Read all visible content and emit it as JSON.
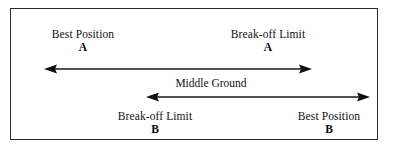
{
  "diagram": {
    "frame": {
      "border_color": "#2b2b2b",
      "background": "#ffffff"
    },
    "labels": {
      "best_position_a": {
        "text": "Best Position",
        "letter": "A"
      },
      "breakoff_limit_a": {
        "text": "Break-off Limit",
        "letter": "A"
      },
      "middle_ground": {
        "text": "Middle Ground"
      },
      "breakoff_limit_b": {
        "text": "Break-off Limit",
        "letter": "B"
      },
      "best_position_b": {
        "text": "Best Position",
        "letter": "B"
      }
    },
    "arrows": [
      {
        "name": "range-arrow-a",
        "style": "double-headed",
        "color": "#1a1a1a",
        "from_label": "Best Position A",
        "to_label": "Break-off Limit A",
        "length_px": 267
      },
      {
        "name": "range-arrow-b",
        "style": "double-headed",
        "color": "#1a1a1a",
        "from_label": "Break-off Limit B",
        "to_label": "Best Position B",
        "length_px": 223
      }
    ]
  }
}
